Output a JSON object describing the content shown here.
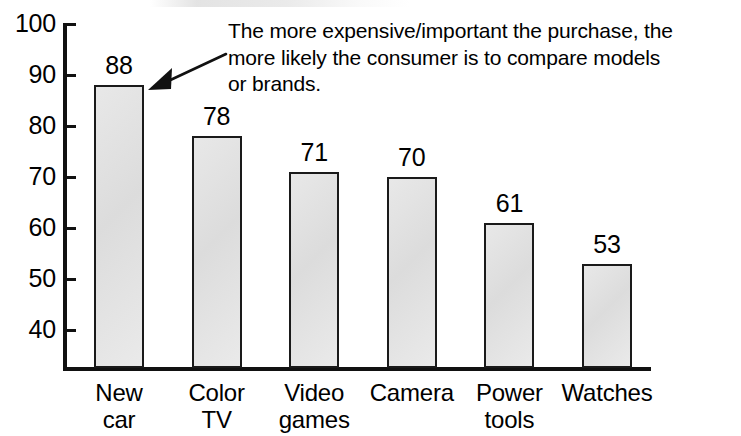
{
  "chart_data": {
    "type": "bar",
    "title": "",
    "subtitle": "",
    "xlabel": "",
    "ylabel": "",
    "categories": [
      "New car",
      "Color TV",
      "Video games",
      "Camera",
      "Power tools",
      "Watches"
    ],
    "values": [
      88,
      78,
      71,
      70,
      61,
      53
    ],
    "value_labels": [
      "88",
      "78",
      "71",
      "70",
      "61",
      "53"
    ],
    "category_lines": [
      [
        "New",
        "car"
      ],
      [
        "Color",
        "TV"
      ],
      [
        "Video",
        "games"
      ],
      [
        "Camera"
      ],
      [
        "Power",
        "tools"
      ],
      [
        "Watches"
      ]
    ],
    "ylim": [
      32.5,
      100
    ],
    "yticks": [
      100,
      90,
      80,
      70,
      60,
      50,
      40
    ],
    "ytick_labels": [
      "100",
      "90",
      "80",
      "70",
      "60",
      "50",
      "40"
    ],
    "grid": false,
    "legend": null,
    "annotations": [
      {
        "name": "callout",
        "lines": [
          "The more expensive/important the purchase, the",
          "more likely the consumer is to compare models",
          "or brands."
        ],
        "points_to": "New car",
        "arrow": true
      }
    ],
    "colors": {
      "bar_fill": "#e2e2e2",
      "bar_outline": "#1a1a1a",
      "axis": "#111111",
      "text": "#000000",
      "background": "#ffffff"
    }
  },
  "annotation": {
    "line1": "The more expensive/important the purchase, the",
    "line2": "more likely the consumer is to compare models",
    "line3": "or brands."
  }
}
